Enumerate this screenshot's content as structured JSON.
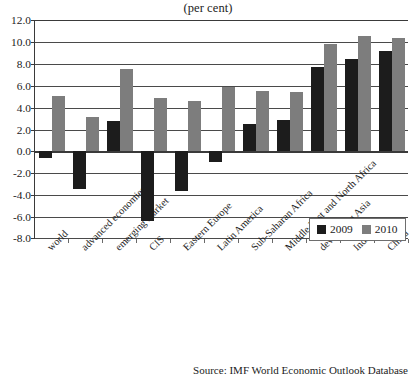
{
  "chart_data": {
    "type": "bar",
    "title": "(per cent)",
    "subtitle": "",
    "xlabel": "",
    "ylabel": "",
    "ylim": [
      -8.0,
      12.0
    ],
    "ytick_step": 2.0,
    "yticks": [
      "12.0",
      "10.0",
      "8.0",
      "6.0",
      "4.0",
      "2.0",
      "0.0",
      "-2.0",
      "-4.0",
      "-6.0",
      "-8.0"
    ],
    "ytick_values": [
      12.0,
      10.0,
      8.0,
      6.0,
      4.0,
      2.0,
      0.0,
      -2.0,
      -4.0,
      -6.0,
      -8.0
    ],
    "grid": true,
    "legend_position": "inside-bottom-right",
    "categories": [
      "world",
      "advanced economies",
      "emerging market",
      "CIS",
      "Eastern Europe",
      "Latin America",
      "Sub-Saharan Africa",
      "Middle East and North Africa",
      "developing Asia",
      "India",
      "China"
    ],
    "series": [
      {
        "name": "2009",
        "color": "#1c1c1c",
        "values": [
          -0.6,
          -3.4,
          2.8,
          -6.4,
          -3.6,
          -1.0,
          2.5,
          2.9,
          7.7,
          8.4,
          9.2
        ]
      },
      {
        "name": "2010",
        "color": "#7d7d7d",
        "values": [
          5.1,
          3.1,
          7.5,
          4.9,
          4.6,
          5.9,
          5.5,
          5.4,
          9.8,
          10.5,
          10.4
        ]
      }
    ],
    "source": "Source: IMF World Economic Outlook Database"
  }
}
